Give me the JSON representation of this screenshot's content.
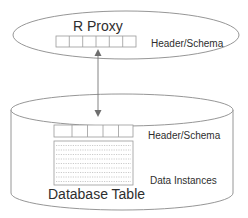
{
  "diagram": {
    "proxy": {
      "title": "R Proxy",
      "header_label": "Header/Schema",
      "header_cells": 6
    },
    "database": {
      "title": "Database Table",
      "header_label": "Header/Schema",
      "data_label": "Data Instances",
      "header_cells": 5,
      "data_rows": 9
    },
    "connector": {
      "type": "bidirectional-arrow",
      "from": "R Proxy header/schema",
      "to": "Database Table header/schema"
    },
    "colors": {
      "stroke": "#8a8a8a",
      "text": "#2e2e2e",
      "arrow": "#6e6e6e",
      "background": "#ffffff"
    }
  }
}
